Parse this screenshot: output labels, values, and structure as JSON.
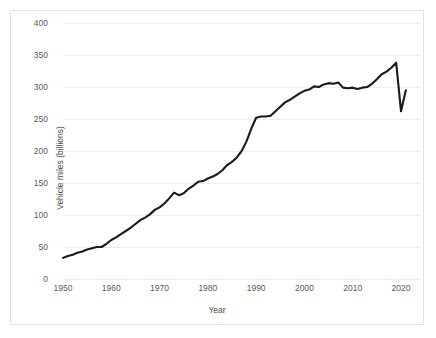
{
  "figure": {
    "background": "#ffffff",
    "border_color": "#e3e3e3",
    "line_color": "#1a1a1a",
    "grid_color": "#eceded",
    "tick_text_color": "#5a5a5a"
  },
  "axes": {
    "y_title": "Vehicle miles (billions)",
    "x_title": "Year",
    "y_ticks": [
      "0",
      "50",
      "100",
      "150",
      "200",
      "250",
      "300",
      "350",
      "400"
    ],
    "x_ticks": [
      "1950",
      "1960",
      "1970",
      "1980",
      "1990",
      "2000",
      "2010",
      "2020"
    ]
  },
  "chart_data": {
    "type": "line",
    "title": "",
    "xlabel": "Year",
    "ylabel": "Vehicle miles (billions)",
    "xlim": [
      1950,
      2021
    ],
    "ylim": [
      0,
      400
    ],
    "xticks": [
      1950,
      1960,
      1970,
      1980,
      1990,
      2000,
      2010,
      2020
    ],
    "yticks": [
      0,
      50,
      100,
      150,
      200,
      250,
      300,
      350,
      400
    ],
    "grid": "horizontal",
    "legend": "none",
    "series": [
      {
        "name": "Vehicle miles traveled",
        "color": "#1a1a1a",
        "x": [
          1950,
          1951,
          1952,
          1953,
          1954,
          1955,
          1956,
          1957,
          1958,
          1959,
          1960,
          1961,
          1962,
          1963,
          1964,
          1965,
          1966,
          1967,
          1968,
          1969,
          1970,
          1971,
          1972,
          1973,
          1974,
          1975,
          1976,
          1977,
          1978,
          1979,
          1980,
          1981,
          1982,
          1983,
          1984,
          1985,
          1986,
          1987,
          1988,
          1989,
          1990,
          1991,
          1992,
          1993,
          1994,
          1995,
          1996,
          1997,
          1998,
          1999,
          2000,
          2001,
          2002,
          2003,
          2004,
          2005,
          2006,
          2007,
          2008,
          2009,
          2010,
          2011,
          2012,
          2013,
          2014,
          2015,
          2016,
          2017,
          2018,
          2019,
          2020,
          2021
        ],
        "y": [
          33,
          36,
          38,
          41,
          43,
          46,
          48,
          50,
          50,
          55,
          61,
          65,
          70,
          75,
          80,
          86,
          92,
          96,
          101,
          108,
          112,
          118,
          126,
          135,
          131,
          134,
          141,
          146,
          152,
          153,
          157,
          160,
          164,
          170,
          178,
          183,
          190,
          200,
          215,
          235,
          252,
          254,
          254,
          255,
          262,
          269,
          276,
          280,
          285,
          290,
          294,
          296,
          301,
          300,
          304,
          306,
          305,
          307,
          299,
          298,
          299,
          297,
          299,
          300,
          305,
          312,
          320,
          324,
          330,
          338,
          262,
          295
        ]
      }
    ]
  }
}
